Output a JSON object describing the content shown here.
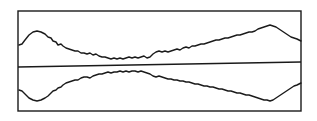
{
  "figure": {
    "stroke_color": "#1a1a1a",
    "background_color": "#ffffff",
    "frame": {
      "x": 18,
      "y": 11,
      "width": 283,
      "height": 100
    },
    "center_axis": {
      "x1": 18,
      "y1": 67,
      "x2": 301,
      "y2": 62
    },
    "upper_trace": {
      "points": "19,45 22,44 25,40 29,35 33,32 37,31 41,32 45,34 48,37 51,38 53,41 56,42 58,45 61,44 63,46 66,48 69,49 72,50 75,51 78,51 81,53 84,53 87,54 90,53 93,55 96,54 99,56 102,57 105,57 108,58 111,59 114,58 117,59 120,58 123,59 126,58 129,57 132,58 135,57 138,58 141,57 144,56 147,58 150,57 153,54 156,52 159,51 162,52 165,51 168,52 171,51 174,50 177,49 180,50 183,48 186,47 189,48 192,46 195,46 198,45 201,44 204,44 207,43 210,42 213,41 216,40 219,40 222,39 225,38 228,38 231,37 234,36 237,35 240,35 243,34 246,33 249,32 252,32 255,31 258,29 261,28 264,27 267,26 270,25 273,26 276,27 279,29 282,31 285,33 288,35 291,37 294,38 297,39 301,41"
    },
    "lower_trace": {
      "points": "19,90 22,91 25,94 29,98 33,100 37,101 41,100 45,98 48,96 51,93 53,91 56,90 58,88 61,87 63,85 66,83 69,82 72,81 75,80 78,80 81,78 84,77 87,77 90,78 93,76 96,75 99,74 102,74 105,73 108,72 111,73 114,72 117,72 120,71 123,72 126,71 129,72 132,71 135,71 138,72 141,71 144,72 147,73 150,74 153,76 156,77 159,76 162,77 165,78 168,79 171,79 174,80 177,80 180,81 183,81 186,82 189,82 192,83 195,84 198,84 201,85 204,86 207,86 210,87 213,87 216,88 219,89 222,89 225,90 228,91 231,91 234,92 237,93 240,93 243,94 246,95 249,95 252,96 255,97 258,98 261,99 264,100 267,100 270,101 273,100 276,98 279,96 282,94 285,92 288,90 291,88 294,86 297,85 301,83"
    }
  }
}
